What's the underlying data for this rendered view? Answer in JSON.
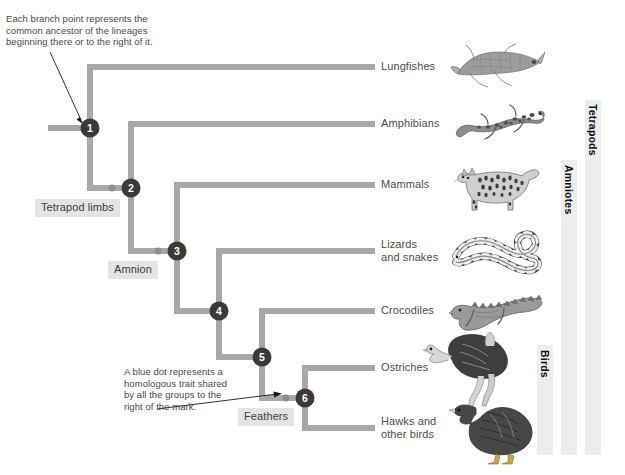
{
  "diagram": {
    "type": "cladogram",
    "background_color": "#ffffff",
    "branch_color": "#a8a8a8",
    "node_color": "#3a3a3a",
    "trait_dot_color": "#9a9a9a",
    "label_color": "#4d4d4d",
    "group_bar_color": "#ededed"
  },
  "annotations": [
    {
      "id": "branch-point-note",
      "text": "Each branch point represents the\ncommon ancestor of the lineages\nbeginning there or to the right of it.",
      "points_to": "node-1"
    },
    {
      "id": "blue-dot-note",
      "text": "A blue dot represents a\nhomologous trait shared\nby all the groups to the\nright of the mark.",
      "points_to": "trait-feathers"
    }
  ],
  "nodes": [
    {
      "id": "node-1",
      "number": "1",
      "x": 90,
      "y": 128
    },
    {
      "id": "node-2",
      "number": "2",
      "x": 131,
      "y": 188
    },
    {
      "id": "node-3",
      "number": "3",
      "x": 177,
      "y": 251
    },
    {
      "id": "node-4",
      "number": "4",
      "x": 219,
      "y": 311
    },
    {
      "id": "node-5",
      "number": "5",
      "x": 262,
      "y": 357
    },
    {
      "id": "node-6",
      "number": "6",
      "x": 305,
      "y": 398
    }
  ],
  "traits": [
    {
      "id": "trait-tetrapod-limbs",
      "label": "Tetrapod limbs",
      "dot_x": 112,
      "dot_y": 188,
      "box_left": 35,
      "box_top": 199
    },
    {
      "id": "trait-amnion",
      "label": "Amnion",
      "dot_x": 158,
      "dot_y": 251,
      "box_left": 108,
      "box_top": 261
    },
    {
      "id": "trait-feathers",
      "label": "Feathers",
      "dot_x": 286,
      "dot_y": 398,
      "box_left": 238,
      "box_top": 408
    }
  ],
  "tips": [
    {
      "id": "tip-lungfishes",
      "label": "Lungfishes",
      "y": 67,
      "label_left": 381,
      "label_top": 60,
      "organism": "lungfish-illustration",
      "organism_left": 450,
      "organism_top": 40,
      "organism_width": 92,
      "organism_height": 52
    },
    {
      "id": "tip-amphibians",
      "label": "Amphibians",
      "y": 124,
      "label_left": 381,
      "label_top": 117,
      "organism": "salamander-illustration",
      "organism_left": 452,
      "organism_top": 100,
      "organism_width": 92,
      "organism_height": 50
    },
    {
      "id": "tip-mammals",
      "label": "Mammals",
      "y": 185,
      "label_left": 381,
      "label_top": 178,
      "organism": "cat-illustration",
      "organism_left": 452,
      "organism_top": 158,
      "organism_width": 88,
      "organism_height": 58
    },
    {
      "id": "tip-lizards",
      "label": "Lizards\nand snakes",
      "y": 251,
      "label_left": 381,
      "label_top": 238,
      "organism": "snake-illustration",
      "organism_left": 450,
      "organism_top": 228,
      "organism_width": 90,
      "organism_height": 50
    },
    {
      "id": "tip-crocodiles",
      "label": "Crocodiles",
      "y": 311,
      "label_left": 381,
      "label_top": 304,
      "organism": "crocodile-illustration",
      "organism_left": 448,
      "organism_top": 288,
      "organism_width": 96,
      "organism_height": 54
    },
    {
      "id": "tip-ostriches",
      "label": "Ostriches",
      "y": 368,
      "label_left": 381,
      "label_top": 361,
      "organism": "ostrich-illustration",
      "organism_left": 424,
      "organism_top": 336,
      "organism_width": 86,
      "organism_height": 72
    },
    {
      "id": "tip-hawks",
      "label": "Hawks and\nother birds",
      "y": 428,
      "label_left": 381,
      "label_top": 415,
      "organism": "hawk-illustration",
      "organism_left": 448,
      "organism_top": 398,
      "organism_width": 90,
      "organism_height": 66
    }
  ],
  "group_bars": [
    {
      "id": "group-tetrapods",
      "label": "Tetrapods",
      "left": 585,
      "top": 100,
      "width": 16,
      "height": 355,
      "label_top": 104
    },
    {
      "id": "group-amniotes",
      "label": "Amniotes",
      "left": 561,
      "top": 160,
      "width": 16,
      "height": 295,
      "label_top": 165
    },
    {
      "id": "group-birds",
      "label": "Birds",
      "left": 537,
      "top": 345,
      "width": 16,
      "height": 110,
      "label_top": 350
    }
  ],
  "root": {
    "x1": 48,
    "x2": 90,
    "y": 128
  }
}
